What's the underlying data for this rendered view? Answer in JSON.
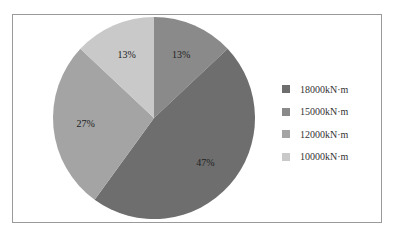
{
  "chart_data": {
    "type": "pie",
    "title": "",
    "start_angle_deg": 90,
    "direction": "clockwise",
    "slices": [
      {
        "label": "15000kN·m",
        "value": 13,
        "display": "13%",
        "color": "#8a8a8a"
      },
      {
        "label": "18000kN·m",
        "value": 47,
        "display": "47%",
        "color": "#6e6e6e"
      },
      {
        "label": "12000kN·m",
        "value": 27,
        "display": "27%",
        "color": "#a4a4a4"
      },
      {
        "label": "10000kN·m",
        "value": 13,
        "display": "13%",
        "color": "#c9c9c9"
      }
    ],
    "legend": {
      "position": "right",
      "entries": [
        {
          "label": "18000kN·m",
          "color": "#6e6e6e"
        },
        {
          "label": "15000kN·m",
          "color": "#8a8a8a"
        },
        {
          "label": "12000kN·m",
          "color": "#a4a4a4"
        },
        {
          "label": "10000kN·m",
          "color": "#c9c9c9"
        }
      ]
    }
  }
}
